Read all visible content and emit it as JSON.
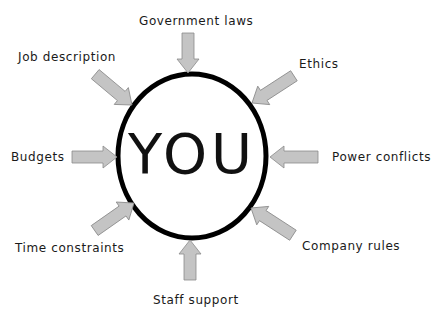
{
  "diagram": {
    "center": {
      "label": "YOU"
    },
    "colors": {
      "arrow_fill": "#c4c4c4",
      "arrow_stroke": "#8a8a8a",
      "circle_stroke": "#000000",
      "text": "#1a1a1a"
    },
    "influences": [
      {
        "id": "government-laws",
        "label": "Government laws",
        "position": "top"
      },
      {
        "id": "ethics",
        "label": "Ethics",
        "position": "top-right"
      },
      {
        "id": "power-conflicts",
        "label": "Power conflicts",
        "position": "right"
      },
      {
        "id": "company-rules",
        "label": "Company rules",
        "position": "bottom-right"
      },
      {
        "id": "staff-support",
        "label": "Staff support",
        "position": "bottom"
      },
      {
        "id": "time-constraints",
        "label": "Time constraints",
        "position": "bottom-left"
      },
      {
        "id": "budgets",
        "label": "Budgets",
        "position": "left"
      },
      {
        "id": "job-description",
        "label": "Job description",
        "position": "top-left"
      }
    ]
  }
}
